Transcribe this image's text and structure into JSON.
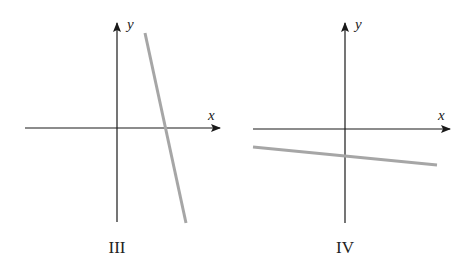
{
  "panels": [
    {
      "label": "III",
      "x_axis_label": "x",
      "y_axis_label": "y",
      "line": {
        "description": "steep negative slope, positive x-intercept",
        "color": "#a6a6a6"
      }
    },
    {
      "label": "IV",
      "x_axis_label": "x",
      "y_axis_label": "y",
      "line": {
        "description": "shallow negative slope, negative y-intercept",
        "color": "#a6a6a6"
      }
    }
  ],
  "colors": {
    "axis": "#1a1a1a",
    "line": "#a6a6a6"
  }
}
